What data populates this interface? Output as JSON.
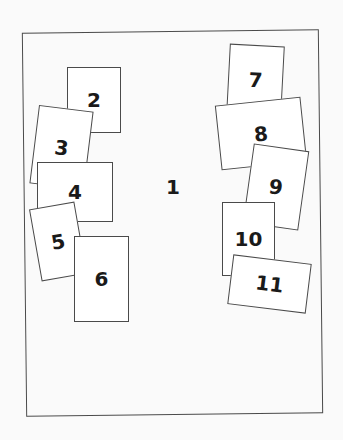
{
  "diagram": {
    "title": "",
    "frame": {
      "label": "1",
      "border_color": "#4a4a4a",
      "background": "#fafafa"
    },
    "cards": [
      {
        "id": "card-2",
        "label": "2",
        "x": 67,
        "y": 67,
        "w": 54,
        "h": 66,
        "rotate": 0,
        "z": 1
      },
      {
        "id": "card-3",
        "label": "3",
        "x": 34,
        "y": 108,
        "w": 55,
        "h": 79,
        "rotate": 7,
        "z": 2
      },
      {
        "id": "card-4",
        "label": "4",
        "x": 37,
        "y": 162,
        "w": 76,
        "h": 60,
        "rotate": 0,
        "z": 3
      },
      {
        "id": "card-5",
        "label": "5",
        "x": 35,
        "y": 205,
        "w": 46,
        "h": 73,
        "rotate": -10,
        "z": 4
      },
      {
        "id": "card-6",
        "label": "6",
        "x": 74,
        "y": 236,
        "w": 55,
        "h": 86,
        "rotate": 0,
        "z": 5
      },
      {
        "id": "card-7",
        "label": "7",
        "x": 228,
        "y": 45,
        "w": 55,
        "h": 70,
        "rotate": 3,
        "z": 1
      },
      {
        "id": "card-8",
        "label": "8",
        "x": 218,
        "y": 101,
        "w": 86,
        "h": 65,
        "rotate": -6,
        "z": 2
      },
      {
        "id": "card-9",
        "label": "9",
        "x": 248,
        "y": 147,
        "w": 56,
        "h": 80,
        "rotate": 8,
        "z": 3
      },
      {
        "id": "card-10",
        "label": "10",
        "x": 222,
        "y": 202,
        "w": 53,
        "h": 74,
        "rotate": 0,
        "z": 4
      },
      {
        "id": "card-11",
        "label": "11",
        "x": 230,
        "y": 259,
        "w": 79,
        "h": 50,
        "rotate": 7,
        "z": 5
      }
    ]
  }
}
